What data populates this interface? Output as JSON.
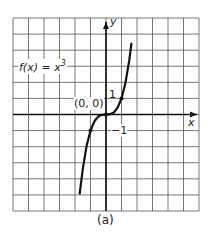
{
  "chart_data": {
    "type": "line",
    "title": "",
    "function_label": "f(x) = x³",
    "xlabel": "x",
    "ylabel": "y",
    "caption": "(a)",
    "xlim": [
      -6,
      6
    ],
    "ylim": [
      -6,
      6
    ],
    "grid": true,
    "series": [
      {
        "name": "f(x) = x^3",
        "x": [
          -1.7,
          -1.5,
          -1.25,
          -1,
          -0.75,
          -0.5,
          -0.25,
          0,
          0.25,
          0.5,
          0.75,
          1,
          1.25,
          1.5,
          1.64
        ],
        "y": [
          -4.91,
          -3.375,
          -1.95,
          -1,
          -0.42,
          -0.125,
          -0.016,
          0,
          0.016,
          0.125,
          0.42,
          1,
          1.95,
          3.375,
          4.41
        ]
      }
    ],
    "marked_points": [
      {
        "x": 0,
        "y": 0,
        "label": "(0, 0)"
      },
      {
        "x": 1,
        "y": 1,
        "label": "1"
      },
      {
        "x": -1,
        "y": -1,
        "label": "−1"
      }
    ]
  },
  "labels": {
    "function": "f(x) = x",
    "exponent": "3",
    "origin": "(0, 0)",
    "tick_pos": "1",
    "tick_neg": "−1",
    "x_axis": "x",
    "y_axis": "y",
    "caption": "(a)"
  }
}
